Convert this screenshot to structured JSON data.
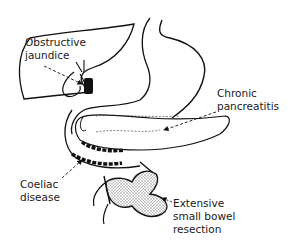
{
  "diagram": {
    "type": "anatomical-illustration",
    "colors": {
      "line": "#111111",
      "background": "#ffffff",
      "stipple": "#888888"
    },
    "labels": {
      "obstructive_jaundice": {
        "line1": "Obstructive",
        "line2": "jaundice"
      },
      "chronic_pancreatitis": {
        "line1": "Chronic",
        "line2": "pancreatitis"
      },
      "coeliac_disease": {
        "line1": "Coeliac",
        "line2": "disease"
      },
      "small_bowel_resection": {
        "line1": "Extensive",
        "line2": "small bowel",
        "line3": "resection"
      }
    }
  }
}
